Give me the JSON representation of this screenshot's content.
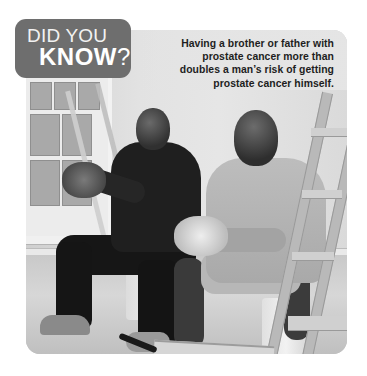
{
  "badge": {
    "line1": "DID YOU",
    "line2": "KNOW",
    "punctuation": "?",
    "color": "#6e6e6e"
  },
  "fact": {
    "text": "Having a brother or father with prostate cancer more than doubles a man’s risk of getting prostate cancer himself."
  },
  "photo": {
    "description": "Two men sitting and laughing in a room being painted, with ladders, paint buckets and a paint tray",
    "style": "grayscale"
  }
}
